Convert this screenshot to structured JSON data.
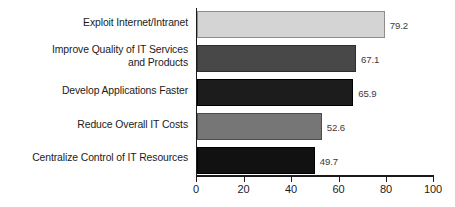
{
  "chart_data": {
    "type": "bar",
    "orientation": "horizontal",
    "title": "",
    "subtitle": "",
    "xlabel": "",
    "ylabel": "",
    "xlim": [
      0,
      100
    ],
    "xticks": [
      0,
      20,
      40,
      60,
      80,
      100
    ],
    "grid": false,
    "legend": null,
    "categories": [
      "Exploit Internet/Intranet",
      "Improve Quality of IT Services\nand Products",
      "Develop Applications Faster",
      "Reduce Overall IT Costs",
      "Centralize Control of IT Resources"
    ],
    "values": [
      79.2,
      67.1,
      65.9,
      52.6,
      49.7
    ],
    "value_labels": [
      "79.2",
      "67.1",
      "65.9",
      "52.6",
      "49.7"
    ],
    "bar_colors": [
      "#d4d4d4",
      "#484848",
      "#1c1c1c",
      "#767676",
      "#111111"
    ],
    "bar_border_colors": [
      "#8c8c8c",
      "#2e2e2e",
      "#000000",
      "#4d4d4d",
      "#000000"
    ],
    "axis_color": "#1b1b1b",
    "tick_labels": [
      "0",
      "20",
      "40",
      "60",
      "80",
      "100"
    ]
  }
}
